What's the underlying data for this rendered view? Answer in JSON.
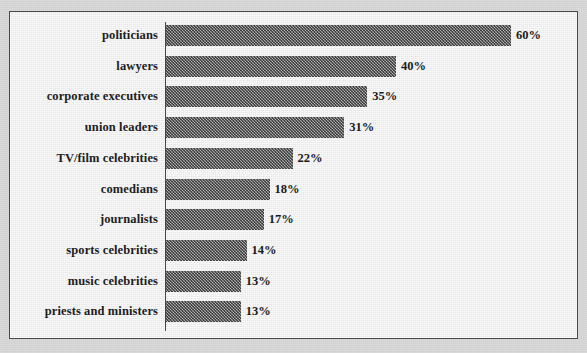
{
  "chart_data": {
    "type": "bar",
    "orientation": "horizontal",
    "title": "",
    "xlabel": "",
    "ylabel": "",
    "xlim": [
      0,
      60
    ],
    "grid": false,
    "legend": false,
    "value_suffix": "%",
    "categories": [
      "politicians",
      "lawyers",
      "corporate executives",
      "union leaders",
      "TV/film celebrities",
      "comedians",
      "journalists",
      "sports celebrities",
      "music celebrities",
      "priests and ministers"
    ],
    "values": [
      60,
      40,
      35,
      31,
      22,
      18,
      17,
      14,
      13,
      13
    ],
    "data_labels": [
      "60%",
      "40%",
      "35%",
      "31%",
      "22%",
      "18%",
      "17%",
      "14%",
      "13%",
      "13%"
    ],
    "colors": {
      "bar_fill": "#8c8c8c",
      "plot_background": "#ececec",
      "page_background": "#d8d8d8",
      "axis": "#454545",
      "text": "#1d1d1d"
    }
  }
}
